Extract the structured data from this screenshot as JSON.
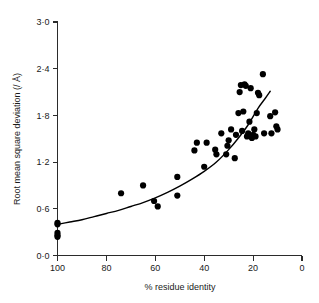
{
  "figure": {
    "background_color": "#ffffff",
    "ink_color": "#000000"
  },
  "chart_data": {
    "type": "scatter",
    "title": "",
    "subtitle": "",
    "xlabel": "% residue identity",
    "ylabel": "Root mean square deviation (/ Å)",
    "xlim": [
      100,
      0
    ],
    "ylim": [
      0.0,
      3.0
    ],
    "x_axis_reversed": true,
    "grid": false,
    "legend": null,
    "legend_position": "none",
    "xticks": [
      100,
      80,
      60,
      40,
      20,
      0
    ],
    "xtick_labels": [
      "100",
      "80",
      "60",
      "40",
      "20",
      "0"
    ],
    "yticks": [
      0.0,
      0.6,
      1.2,
      1.8,
      2.4,
      3.0
    ],
    "ytick_labels": [
      "0·0",
      "0·6",
      "1·2",
      "1·8",
      "2·4",
      "3·0"
    ],
    "tick_direction": "out",
    "point_marker": "filled-circle",
    "point_color": "#000000",
    "point_radius_px": 3.1,
    "series": [
      {
        "name": "protein pairs",
        "x": [
          100,
          100,
          100,
          100,
          100,
          74,
          65,
          60.5,
          59,
          51,
          51,
          44,
          43,
          40,
          39,
          35.5,
          35,
          33,
          31,
          30.5,
          30,
          29,
          27.5,
          27,
          26,
          25.5,
          25,
          24.5,
          24,
          23.5,
          23,
          22.5,
          22,
          21.5,
          21,
          20.5,
          20,
          19.5,
          19,
          18.5,
          18,
          17.5,
          16,
          15.5,
          13,
          12.5,
          11,
          10.5,
          10
        ],
        "y": [
          0.42,
          0.4,
          0.29,
          0.26,
          0.24,
          0.8,
          0.9,
          0.7,
          0.63,
          1.01,
          0.77,
          1.35,
          1.45,
          1.14,
          1.45,
          1.36,
          1.3,
          1.57,
          1.3,
          1.41,
          1.48,
          1.62,
          1.25,
          1.55,
          1.83,
          2.1,
          2.19,
          1.6,
          1.85,
          2.2,
          2.18,
          1.53,
          1.57,
          1.72,
          2.15,
          1.51,
          1.55,
          1.62,
          1.53,
          1.83,
          2.09,
          2.06,
          2.33,
          1.57,
          1.79,
          1.57,
          1.84,
          1.66,
          1.62
        ],
        "n_points": 49
      }
    ],
    "fit_curve": {
      "label": "fitted trend",
      "style": "solid",
      "color": "#000000",
      "points_x": [
        100,
        95,
        90,
        85,
        80,
        75,
        70,
        65,
        60,
        55,
        50,
        45,
        40,
        35,
        30,
        26,
        22,
        18,
        15,
        13
      ],
      "points_y": [
        0.4,
        0.43,
        0.46,
        0.5,
        0.54,
        0.58,
        0.63,
        0.68,
        0.74,
        0.81,
        0.89,
        0.98,
        1.08,
        1.2,
        1.36,
        1.51,
        1.68,
        1.89,
        2.02,
        2.11
      ]
    }
  }
}
